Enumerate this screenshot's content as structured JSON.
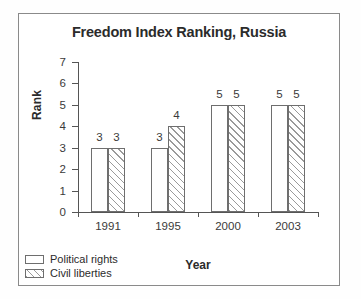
{
  "chart_data": {
    "type": "bar",
    "title": "Freedom Index Ranking, Russia",
    "xlabel": "Year",
    "ylabel": "Rank",
    "categories": [
      "1991",
      "1995",
      "2000",
      "2003"
    ],
    "series": [
      {
        "name": "Political rights",
        "values": [
          3,
          3,
          5,
          5
        ],
        "fill": "white"
      },
      {
        "name": "Civil liberties",
        "values": [
          3,
          4,
          5,
          5
        ],
        "fill": "diagonal-hatch"
      }
    ],
    "ylim": [
      0,
      7
    ],
    "yticks": [
      "0",
      "1",
      "2",
      "3",
      "4",
      "5",
      "6",
      "7"
    ],
    "grid": false,
    "legend_position": "bottom-left",
    "data_labels": true,
    "colors": {
      "axis": "#555555",
      "bar_outline": "#6e6e6e",
      "hatch": "#9a9a9a",
      "text": "#2b2b2b",
      "frame": "#8a8a8a",
      "background": "#ffffff"
    }
  },
  "legend": {
    "items": [
      {
        "label": "Political rights"
      },
      {
        "label": "Civil liberties"
      }
    ]
  }
}
